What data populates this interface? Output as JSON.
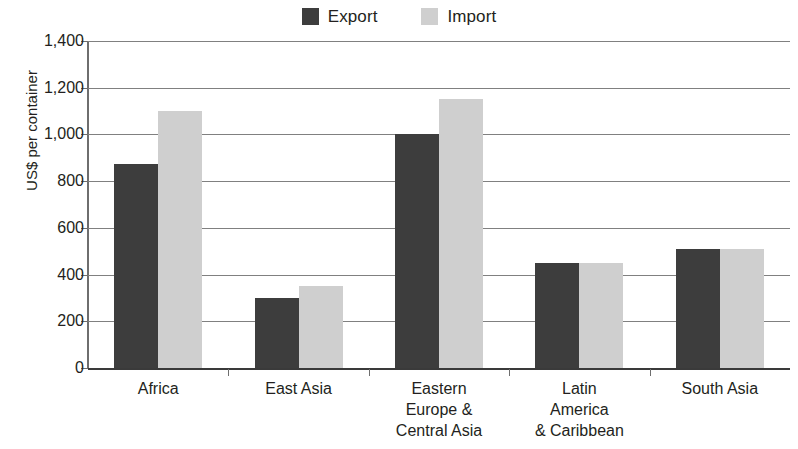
{
  "chart_data": {
    "type": "bar",
    "title": "",
    "subtitle": "",
    "xlabel": "",
    "ylabel": "US$ per container",
    "ylim": [
      0,
      1400
    ],
    "ytick_step": 200,
    "ytick_labels": [
      "0",
      "200",
      "400",
      "600",
      "800",
      "1,000",
      "1,200",
      "1,400"
    ],
    "ytick_values": [
      0,
      200,
      400,
      600,
      800,
      1000,
      1200,
      1400
    ],
    "grid": "horizontal",
    "legend_position": "top-center",
    "categories": [
      "Africa",
      "East Asia",
      "Eastern\nEurope &\nCentral Asia",
      "Latin\nAmerica\n& Caribbean",
      "South Asia"
    ],
    "category_lines": [
      [
        "Africa"
      ],
      [
        "East Asia"
      ],
      [
        "Eastern",
        "Europe &",
        "Central Asia"
      ],
      [
        "Latin",
        "America",
        "& Caribbean"
      ],
      [
        "South Asia"
      ]
    ],
    "series": [
      {
        "name": "Export",
        "color": "#3d3d3d",
        "values": [
          875,
          300,
          1000,
          450,
          510
        ]
      },
      {
        "name": "Import",
        "color": "#cfcfcf",
        "values": [
          1100,
          350,
          1150,
          450,
          510
        ]
      }
    ]
  },
  "legend": {
    "entries": [
      {
        "label": "Export",
        "color": "#3d3d3d"
      },
      {
        "label": "Import",
        "color": "#cfcfcf"
      }
    ]
  }
}
